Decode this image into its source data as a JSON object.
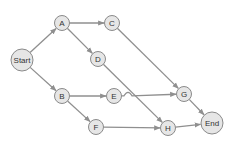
{
  "diagram": {
    "type": "directed-graph",
    "colors": {
      "node_fill": "#e6e6e6",
      "node_stroke": "#8a8a8a",
      "edge": "#8f8f8f",
      "text": "#333333"
    },
    "nodes": [
      {
        "id": "start",
        "label": "Start",
        "x": 22,
        "y": 60,
        "r": 11
      },
      {
        "id": "a",
        "label": "A",
        "x": 62,
        "y": 23,
        "r": 7.5
      },
      {
        "id": "c",
        "label": "C",
        "x": 112,
        "y": 23,
        "r": 7.5
      },
      {
        "id": "d",
        "label": "D",
        "x": 98,
        "y": 59,
        "r": 7.5
      },
      {
        "id": "b",
        "label": "B",
        "x": 62,
        "y": 96,
        "r": 7.5
      },
      {
        "id": "e",
        "label": "E",
        "x": 114,
        "y": 96,
        "r": 7.5
      },
      {
        "id": "f",
        "label": "F",
        "x": 96,
        "y": 127,
        "r": 7.5
      },
      {
        "id": "g",
        "label": "G",
        "x": 184,
        "y": 94,
        "r": 7.5
      },
      {
        "id": "h",
        "label": "H",
        "x": 168,
        "y": 128,
        "r": 7.5
      },
      {
        "id": "end",
        "label": "End",
        "x": 212,
        "y": 123,
        "r": 11
      }
    ],
    "edges": [
      {
        "from": "start",
        "to": "a"
      },
      {
        "from": "start",
        "to": "b"
      },
      {
        "from": "a",
        "to": "c"
      },
      {
        "from": "a",
        "to": "d"
      },
      {
        "from": "c",
        "to": "g"
      },
      {
        "from": "d",
        "to": "h"
      },
      {
        "from": "b",
        "to": "e"
      },
      {
        "from": "b",
        "to": "f"
      },
      {
        "from": "e",
        "to": "g"
      },
      {
        "from": "f",
        "to": "h"
      },
      {
        "from": "g",
        "to": "end"
      },
      {
        "from": "h",
        "to": "end"
      }
    ]
  }
}
